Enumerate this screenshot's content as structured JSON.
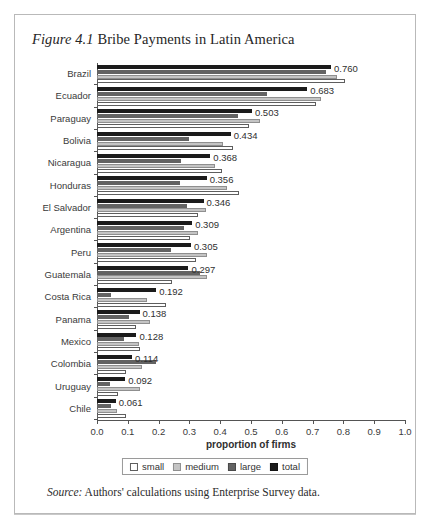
{
  "figure": {
    "number": "Figure 4.1",
    "title": "Bribe Payments in Latin America",
    "source_word": "Source:",
    "source_text": " Authors' calculations using Enterprise Survey data."
  },
  "legend": {
    "items": [
      {
        "key": "small",
        "label": "small",
        "color": "#ffffff"
      },
      {
        "key": "medium",
        "label": "medium",
        "color": "#c4c4c4"
      },
      {
        "key": "large",
        "label": "large",
        "color": "#636363"
      },
      {
        "key": "total",
        "label": "total",
        "color": "#1b1b1b"
      }
    ]
  },
  "chart_data": {
    "type": "bar",
    "orientation": "horizontal",
    "title": "Figure 4.1 Bribe Payments in Latin America",
    "xlabel": "proportion of firms",
    "ylabel": "",
    "xlim": [
      0.0,
      1.0
    ],
    "grid": false,
    "legend_position": "bottom",
    "xticks": [
      "0.0",
      "0.1",
      "0.2",
      "0.3",
      "0.4",
      "0.5",
      "0.6",
      "0.7",
      "0.8",
      "0.9",
      "1.0"
    ],
    "xtick_values": [
      0.0,
      0.1,
      0.2,
      0.3,
      0.4,
      0.5,
      0.6,
      0.7,
      0.8,
      0.9,
      1.0
    ],
    "categories": [
      "Brazil",
      "Ecuador",
      "Paraguay",
      "Bolivia",
      "Nicaragua",
      "Honduras",
      "El Salvador",
      "Argentina",
      "Peru",
      "Guatemala",
      "Costa Rica",
      "Panama",
      "Mexico",
      "Colombia",
      "Uruguay",
      "Chile"
    ],
    "series": [
      {
        "name": "total",
        "values": [
          0.76,
          0.683,
          0.503,
          0.434,
          0.368,
          0.356,
          0.346,
          0.309,
          0.305,
          0.297,
          0.192,
          0.138,
          0.128,
          0.114,
          0.092,
          0.061
        ]
      },
      {
        "name": "large",
        "values": [
          0.742,
          0.552,
          0.458,
          0.3,
          0.272,
          0.268,
          0.293,
          0.282,
          0.24,
          0.336,
          0.045,
          0.103,
          0.087,
          0.192,
          0.043,
          0.046
        ]
      },
      {
        "name": "medium",
        "values": [
          0.779,
          0.726,
          0.528,
          0.408,
          0.384,
          0.421,
          0.355,
          0.329,
          0.356,
          0.357,
          0.163,
          0.171,
          0.137,
          0.147,
          0.139,
          0.066
        ]
      },
      {
        "name": "small",
        "values": [
          0.805,
          0.71,
          0.493,
          0.441,
          0.406,
          0.46,
          0.327,
          0.301,
          0.322,
          0.245,
          0.224,
          0.127,
          0.14,
          0.095,
          0.069,
          0.094
        ]
      }
    ],
    "value_labels": [
      "0.760",
      "0.683",
      "0.503",
      "0.434",
      "0.368",
      "0.356",
      "0.346",
      "0.309",
      "0.305",
      "0.297",
      "0.192",
      "0.138",
      "0.128",
      "0.114",
      "0.092",
      "0.061"
    ]
  }
}
